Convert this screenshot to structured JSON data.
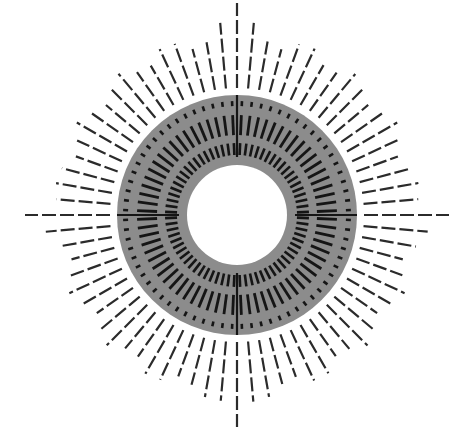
{
  "artwork": {
    "title": "",
    "description": "Radial sunburst of dashed lines around a grey annulus with concentric rings of short black dashes and a white center disc",
    "width": 470,
    "height": 443,
    "center": {
      "x": 237,
      "y": 215
    },
    "colors": {
      "background": "#ffffff",
      "ring_fill": "#8c8c8c",
      "dash": "#2b2b2b",
      "inner_dash": "#151515",
      "center_disc": "#ffffff"
    },
    "center_disc_radius": 50,
    "ring": {
      "inner_radius": 50,
      "outer_radius": 120
    },
    "inner_dash_rings": [
      {
        "name": "inner",
        "count": 72,
        "r_start": 60,
        "r_end": 72,
        "width": 2.6
      },
      {
        "name": "middle",
        "count": 72,
        "r_start": 80,
        "r_end": 100,
        "width": 2.8
      },
      {
        "name": "outer-ticks",
        "count": 72,
        "r_start": 109,
        "r_end": 114,
        "width": 2.6
      }
    ],
    "cross_axes": {
      "r_start": 58,
      "r_end": 120,
      "width": 2.2,
      "angles_deg": [
        0,
        90,
        180,
        270
      ]
    },
    "outer_rays": {
      "count": 72,
      "r_start": 127,
      "width": 2.2,
      "dash_pattern": [
        14,
        4
      ],
      "axis_length": 212,
      "base_length": 178,
      "length_variation": 14
    }
  }
}
